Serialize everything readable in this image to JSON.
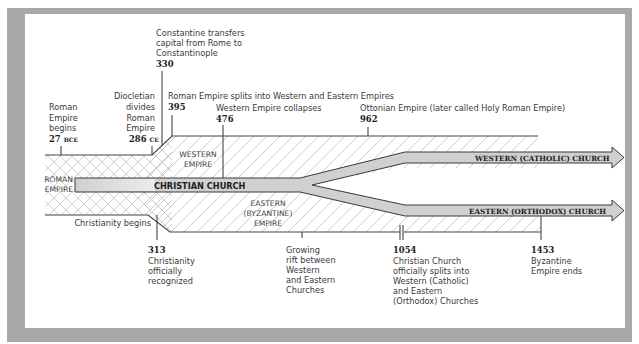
{
  "colors": {
    "frame": "#a9a9a9",
    "band_fill": "#cfcfcf",
    "line": "#444444",
    "hatch": "#b9b9b9"
  },
  "regions": {
    "roman_empire": [
      "ROMAN",
      "EMPIRE"
    ],
    "western_empire": [
      "WESTERN",
      "EMPIRE"
    ],
    "eastern_empire": [
      "EASTERN",
      "(BYZANTINE)",
      "EMPIRE"
    ]
  },
  "bands": {
    "christian_church": "CHRISTIAN CHURCH",
    "western_church": "WESTERN (CATHOLIC) CHURCH",
    "eastern_church": "EASTERN (ORTHODOX) CHURCH"
  },
  "events_top": [
    {
      "id": "roman-empire-begins",
      "lines": [
        "Roman",
        "Empire",
        "begins"
      ],
      "year": "27",
      "era": "BCE"
    },
    {
      "id": "diocletian-divides",
      "lines": [
        "Diocletian",
        "divides",
        "Roman",
        "Empire"
      ],
      "year": "286",
      "era": "CE"
    },
    {
      "id": "constantine-transfers",
      "lines": [
        "Constantine transfers",
        "capital from Rome to",
        "Constantinople"
      ],
      "year": "330"
    },
    {
      "id": "empire-splits",
      "lines": [
        "Roman Empire splits into Western and Eastern Empires"
      ],
      "year": "395"
    },
    {
      "id": "western-collapses",
      "lines": [
        "Western Empire collapses"
      ],
      "year": "476"
    },
    {
      "id": "ottonian-empire",
      "lines": [
        "Ottonian Empire (later called Holy Roman Empire)"
      ],
      "year": "962"
    }
  ],
  "events_bottom": [
    {
      "id": "christianity-begins",
      "lines": [
        "Christianity begins"
      ]
    },
    {
      "id": "christianity-recognized",
      "year": "313",
      "lines": [
        "Christianity",
        "officially",
        "recognized"
      ]
    },
    {
      "id": "growing-rift",
      "lines": [
        "Growing",
        "rift between",
        "Western",
        "and Eastern",
        "Churches"
      ]
    },
    {
      "id": "church-splits",
      "year": "1054",
      "lines": [
        "Christian Church",
        "officially splits into",
        "Western (Catholic)",
        "and Eastern",
        "(Orthodox) Churches"
      ]
    },
    {
      "id": "byzantine-ends",
      "year": "1453",
      "lines": [
        "Byzantine",
        "Empire ends"
      ]
    }
  ]
}
